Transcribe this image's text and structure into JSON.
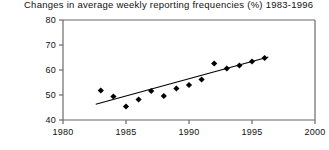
{
  "chart_data": {
    "type": "scatter",
    "title": "Changes in average weekly reporting frequencies (%) 1983-1996",
    "xlabel": "",
    "ylabel": "",
    "xlim": [
      1980,
      2000
    ],
    "ylim": [
      40,
      80
    ],
    "xticks": [
      1980,
      1985,
      1990,
      1995,
      2000
    ],
    "yticks": [
      40,
      50,
      60,
      70,
      80
    ],
    "xtick_labels": [
      "1980",
      "1985",
      "1990",
      "1995",
      "2000"
    ],
    "ytick_labels": [
      "40",
      "50",
      "60",
      "70",
      "80"
    ],
    "grid": false,
    "legend": "none",
    "marker": "diamond",
    "marker_color": "#000000",
    "line_color": "#000000",
    "x": [
      1983,
      1984,
      1985,
      1986,
      1987,
      1988,
      1989,
      1990,
      1991,
      1992,
      1993,
      1994,
      1995,
      1996
    ],
    "values": [
      51.8,
      49.4,
      45.4,
      48.2,
      51.6,
      49.6,
      52.6,
      54.0,
      56.2,
      62.6,
      60.6,
      61.8,
      63.4,
      64.8
    ],
    "series": [
      {
        "name": "Average weekly reporting frequency",
        "type": "scatter",
        "x": [
          1983,
          1984,
          1985,
          1986,
          1987,
          1988,
          1989,
          1990,
          1991,
          1992,
          1993,
          1994,
          1995,
          1996
        ],
        "values": [
          51.8,
          49.4,
          45.4,
          48.2,
          51.6,
          49.6,
          52.6,
          54.0,
          56.2,
          62.6,
          60.6,
          61.8,
          63.4,
          64.8
        ]
      },
      {
        "name": "Linear trend",
        "type": "line",
        "x": [
          1982.6,
          1996.3
        ],
        "values": [
          46.3,
          65.2
        ]
      }
    ]
  },
  "axes": {
    "frame_color": "#6b6b6b"
  }
}
